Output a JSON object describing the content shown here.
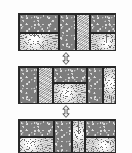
{
  "figure": {
    "background_color": "#fdfdfd",
    "frame_color": "#2a2a2a",
    "cell_border_color": "#262626",
    "panel_count": 3,
    "connector_count": 2
  },
  "panels": [
    {
      "id": "panel-top",
      "label": "Configuration A",
      "x": 18,
      "y": 13,
      "width": 98,
      "height": 38,
      "cells": [
        {
          "name": "cell-a1",
          "texture": "speckled-dark",
          "x": 0,
          "y": 0,
          "width": 40,
          "height": 19,
          "burst_x": 50,
          "burst_y": 50
        },
        {
          "name": "cell-a2",
          "texture": "starburst-light",
          "x": 0,
          "y": 19,
          "width": 40,
          "height": 19,
          "burst_x": 38,
          "burst_y": 30
        },
        {
          "name": "cell-a3",
          "texture": "speckled-dark",
          "x": 40,
          "y": 0,
          "width": 17,
          "height": 38,
          "burst_x": 50,
          "burst_y": 50
        },
        {
          "name": "cell-a4",
          "texture": "noise-light",
          "x": 57,
          "y": 0,
          "width": 14,
          "height": 38,
          "burst_x": 50,
          "burst_y": 50
        },
        {
          "name": "cell-a5",
          "texture": "speckled-dark",
          "x": 71,
          "y": 0,
          "width": 27,
          "height": 19,
          "burst_x": 50,
          "burst_y": 50
        },
        {
          "name": "cell-a6",
          "texture": "starburst-light",
          "x": 71,
          "y": 19,
          "width": 27,
          "height": 19,
          "burst_x": 62,
          "burst_y": 55
        }
      ]
    },
    {
      "id": "panel-middle",
      "label": "Configuration B",
      "x": 18,
      "y": 66,
      "width": 98,
      "height": 38,
      "cells": [
        {
          "name": "cell-b1",
          "texture": "speckled-dark",
          "x": 0,
          "y": 0,
          "width": 19,
          "height": 38,
          "burst_x": 50,
          "burst_y": 50
        },
        {
          "name": "cell-b2",
          "texture": "noise-light",
          "x": 19,
          "y": 0,
          "width": 15,
          "height": 38,
          "burst_x": 50,
          "burst_y": 50
        },
        {
          "name": "cell-b3",
          "texture": "speckled-dark",
          "x": 34,
          "y": 0,
          "width": 34,
          "height": 16,
          "burst_x": 50,
          "burst_y": 50
        },
        {
          "name": "cell-b4",
          "texture": "starburst-light",
          "x": 34,
          "y": 16,
          "width": 34,
          "height": 22,
          "burst_x": 40,
          "burst_y": 45
        },
        {
          "name": "cell-b5",
          "texture": "speckled-dark",
          "x": 68,
          "y": 0,
          "width": 16,
          "height": 38,
          "burst_x": 50,
          "burst_y": 50
        },
        {
          "name": "cell-b6",
          "texture": "starburst-light",
          "x": 84,
          "y": 0,
          "width": 14,
          "height": 38,
          "burst_x": 55,
          "burst_y": 42
        }
      ]
    },
    {
      "id": "panel-bottom",
      "label": "Configuration C",
      "x": 18,
      "y": 119,
      "width": 98,
      "height": 34,
      "cells": [
        {
          "name": "cell-c1",
          "texture": "speckled-dark",
          "x": 0,
          "y": 0,
          "width": 35,
          "height": 17,
          "burst_x": 50,
          "burst_y": 50
        },
        {
          "name": "cell-c2",
          "texture": "starburst-light",
          "x": 0,
          "y": 17,
          "width": 35,
          "height": 17,
          "burst_x": 30,
          "burst_y": 35
        },
        {
          "name": "cell-c3",
          "texture": "speckled-dark",
          "x": 35,
          "y": 0,
          "width": 18,
          "height": 34,
          "burst_x": 50,
          "burst_y": 50
        },
        {
          "name": "cell-c4",
          "texture": "starburst-light",
          "x": 53,
          "y": 0,
          "width": 13,
          "height": 34,
          "burst_x": 50,
          "burst_y": 40
        },
        {
          "name": "cell-c5",
          "texture": "speckled-dark",
          "x": 66,
          "y": 0,
          "width": 32,
          "height": 17,
          "burst_x": 50,
          "burst_y": 50
        },
        {
          "name": "cell-c6",
          "texture": "starburst-light",
          "x": 66,
          "y": 17,
          "width": 32,
          "height": 17,
          "burst_x": 60,
          "burst_y": 50
        }
      ]
    }
  ],
  "connectors": [
    {
      "id": "connector-top",
      "icon": "double-headed-vertical-arrow",
      "x": 61,
      "y": 52,
      "width": 10,
      "height": 13,
      "color": "#3a3a3a"
    },
    {
      "id": "connector-bottom",
      "icon": "double-headed-vertical-arrow",
      "x": 61,
      "y": 105,
      "width": 10,
      "height": 13,
      "color": "#3a3a3a"
    }
  ]
}
